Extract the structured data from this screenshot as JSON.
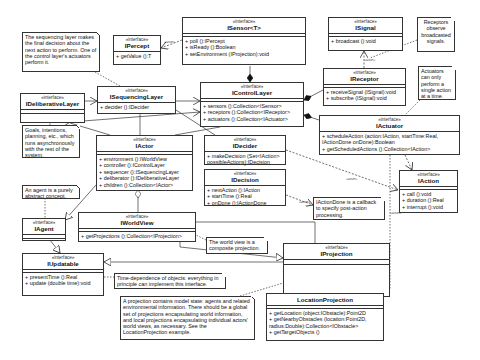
{
  "diagram": {
    "stereotype": "«interface»",
    "classes": {
      "IPercept": {
        "name": "IPercept",
        "ops": [
          "+ getValue ():T"
        ]
      },
      "ISensor": {
        "name": "ISensor<T>",
        "ops": [
          "+ poll ():IPercept",
          "+ isReady ():Boolean",
          "+ setEnvironment (IProjection):void"
        ]
      },
      "ISignal": {
        "name": "ISignal",
        "ops": [
          "+ broadcast ():void"
        ]
      },
      "IReceptor": {
        "name": "IReceptor",
        "ops": [
          "+ receiveSignal (ISignal):void",
          "+ subscribe (ISignal):void"
        ]
      },
      "IDeliberativeLayer": {
        "name": "IDeliberativeLayer",
        "ops": []
      },
      "ISequencingLayer": {
        "name": "ISequencingLayer",
        "ops": [
          "+ decider ():IDecider"
        ]
      },
      "IControlLayer": {
        "name": "IControlLayer",
        "ops": [
          "+ sensors ():Collection<ISensor>",
          "+ receptors ():Collection<IReceptor>",
          "+ actuators ():Collection<IActuator>"
        ]
      },
      "IActor": {
        "name": "IActor",
        "ops": [
          "+ environment ():IWorldView",
          "+ controller ():IControlLayer",
          "+ sequencer ():ISequencingLayer",
          "+ deliberator ():IDeliberativeLayer",
          "+ children ():Collection<IActor>"
        ]
      },
      "IDecider": {
        "name": "IDecider",
        "ops": [
          "+ makeDecision (Set<IAction>",
          "possibleActions):IDecision"
        ]
      },
      "IDecision": {
        "name": "IDecision",
        "ops": [
          "+ nextAction ():IAction",
          "+ startTime ():Real",
          "+ onDone ():IActionDone"
        ]
      },
      "IActuator": {
        "name": "IActuator",
        "ops": [
          "+ scheduleAction (action:IAction, startTime:Real,",
          "IActionDone onDone):Boolean",
          "+ getScheduledActions ():Collection<IAction>"
        ]
      },
      "IAction": {
        "name": "IAction",
        "ops": [
          "+ call ():void",
          "+ duration ():Real",
          "+ interrupt ():void"
        ]
      },
      "IAgent": {
        "name": "IAgent",
        "ops": []
      },
      "IWorldView": {
        "name": "IWorldView",
        "ops": [
          "+ getProjections ():Collection<IProjection>"
        ]
      },
      "IUpdatable": {
        "name": "IUpdatable",
        "ops": [
          "+ presentTime ():Real",
          "+ update (double time):void"
        ]
      },
      "IProjection": {
        "name": "IProjection",
        "ops": []
      },
      "LocationProjection": {
        "name": "LocationProjection",
        "ops": [
          "+ getLocation (object:IObstacle):Point2D",
          "+ getNearbyObstacles (location:Point2D,",
          "radius:Double):Collection<IObstacle>",
          "+ getTargetObjects ()"
        ]
      }
    },
    "notes": {
      "sequencing": "The sequencing layer makes the final decision about the next action to perform.  One of the control layer's actuators perform it.",
      "receptors": "Receptors observe broadcasted signals.",
      "actuators": "Actuators can only perform a single action at a time.",
      "goals": "Goals, intentions, planning, etc., which runs asynchronously with the rest of the system.",
      "agent": "An agent is a purely abstract concept.",
      "actionDone": "IActionDone is a callback to specify post-action processing.",
      "worldView": "The world view is a composite projection.",
      "timeDependence": "Time-dependence of objects: everything in principle can implement this interface.",
      "projection": "A projection contains model state: agents and related environmental information. There should be a global set of projections encapsulating world information, and local projections encapsulating individual actors' world views, as necessary.  See the LocationProjection example."
    },
    "edge_labels": {
      "use": "«use»"
    }
  }
}
